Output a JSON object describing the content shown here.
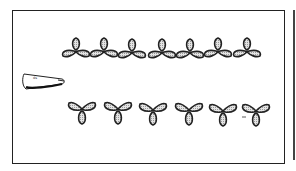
{
  "figure": {
    "nozzle": {
      "icon": "nozzle-icon",
      "label_mark": "ds"
    },
    "top_row": {
      "shape": "three-lobed-inverted-y",
      "count": 7
    },
    "bottom_row": {
      "shape": "three-lobed-y",
      "count": 6
    },
    "annotation_mark": "—",
    "colors": {
      "outline": "#222222",
      "fill": "#c8c8c8",
      "background": "#ffffff"
    }
  }
}
